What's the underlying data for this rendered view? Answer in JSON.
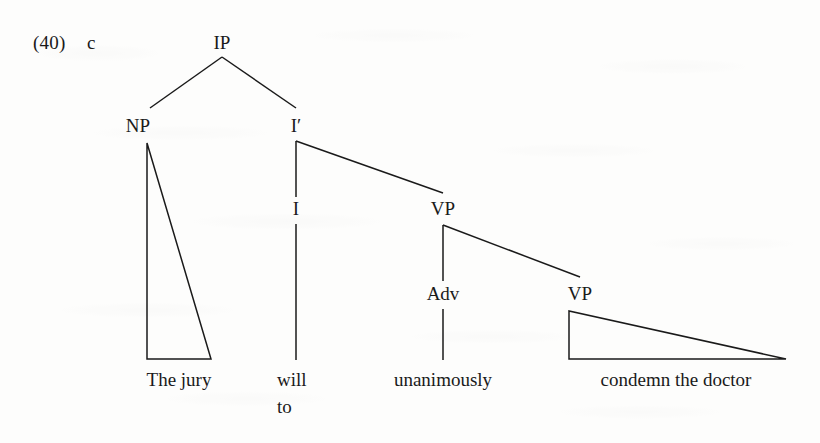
{
  "figure": {
    "example_number": "(40)",
    "example_letter": "c",
    "sentence": "The jury will to unanimously condemn the doctor",
    "ink_color": "#1a1a1a",
    "paper_color": "#fdfdfc"
  },
  "nodes": {
    "ip": {
      "label": "IP",
      "x": 222,
      "y": 48
    },
    "np": {
      "label": "NP",
      "x": 138,
      "y": 131
    },
    "ibar": {
      "label": "I′",
      "x": 296,
      "y": 131
    },
    "i": {
      "label": "I",
      "x": 296,
      "y": 214
    },
    "vp_upper": {
      "label": "VP",
      "x": 443,
      "y": 214
    },
    "adv": {
      "label": "Adv",
      "x": 443,
      "y": 299
    },
    "vp_lower": {
      "label": "VP",
      "x": 580,
      "y": 299
    }
  },
  "terminals": {
    "np_text": {
      "label": "The jury",
      "x": 179,
      "y": 385
    },
    "i_text_line1": {
      "label": "will",
      "x": 277,
      "y": 385
    },
    "i_text_line2": {
      "label": "to",
      "x": 277,
      "y": 412
    },
    "adv_text": {
      "label": "unanimously",
      "x": 443,
      "y": 385
    },
    "vp_text": {
      "label": "condemn the doctor",
      "x": 676,
      "y": 385
    }
  },
  "edges": [
    {
      "name": "ip-to-np",
      "type": "line",
      "x1": 222,
      "y1": 57,
      "x2": 150,
      "y2": 108
    },
    {
      "name": "ip-to-ibar",
      "type": "line",
      "x1": 222,
      "y1": 57,
      "x2": 296,
      "y2": 108
    },
    {
      "name": "ibar-to-i",
      "type": "line",
      "x1": 296,
      "y1": 141,
      "x2": 296,
      "y2": 197
    },
    {
      "name": "ibar-to-vp",
      "type": "line",
      "x1": 296,
      "y1": 141,
      "x2": 443,
      "y2": 193
    },
    {
      "name": "i-to-will",
      "type": "line",
      "x1": 296,
      "y1": 224,
      "x2": 296,
      "y2": 360
    },
    {
      "name": "vp-to-adv",
      "type": "line",
      "x1": 443,
      "y1": 225,
      "x2": 443,
      "y2": 281
    },
    {
      "name": "vp-to-vp",
      "type": "line",
      "x1": 443,
      "y1": 225,
      "x2": 580,
      "y2": 277
    },
    {
      "name": "adv-to-unanimously",
      "type": "line",
      "x1": 443,
      "y1": 309,
      "x2": 443,
      "y2": 360
    }
  ],
  "triangles": [
    {
      "name": "np-triangle",
      "apex_x": 147,
      "apex_y": 143,
      "left_x": 147,
      "right_x": 211,
      "base_y": 359
    },
    {
      "name": "vp-triangle",
      "apex_x": 569,
      "apex_y": 311,
      "left_x": 569,
      "right_x": 786,
      "base_y": 359
    }
  ]
}
